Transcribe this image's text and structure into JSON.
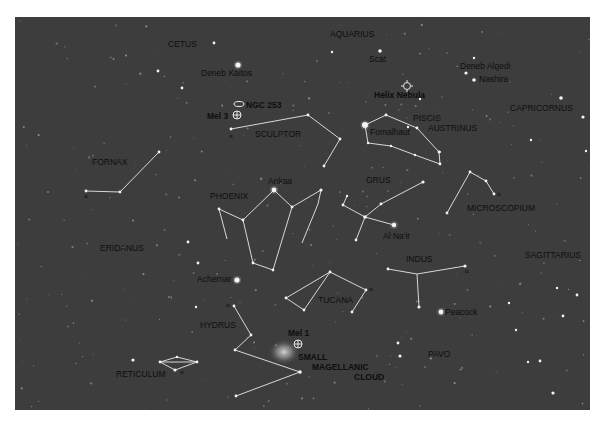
{
  "map": {
    "type": "star-chart",
    "colors": {
      "sky": "#3d3d3d",
      "lines": "#d8d8d8",
      "stars": "#f4f4f4",
      "labels": "#0e0e0e"
    },
    "constellation_labels": [
      {
        "id": "cetus",
        "text": "CETUS",
        "x": 168,
        "y": 47
      },
      {
        "id": "aquarius",
        "text": "AQUARIUS",
        "x": 330,
        "y": 37
      },
      {
        "id": "sculptor",
        "text": "SCULPTOR",
        "x": 255,
        "y": 137
      },
      {
        "id": "piscis-1",
        "text": "PISCIS",
        "x": 413,
        "y": 121
      },
      {
        "id": "piscis-2",
        "text": "AUSTRINUS",
        "x": 428,
        "y": 131
      },
      {
        "id": "capricornus",
        "text": "CAPRICORNUS",
        "x": 510,
        "y": 111
      },
      {
        "id": "fornax",
        "text": "FORNAX",
        "x": 92,
        "y": 165
      },
      {
        "id": "phoenix",
        "text": "PHOENIX",
        "x": 210,
        "y": 199
      },
      {
        "id": "grus",
        "text": "GRUS",
        "x": 366,
        "y": 183
      },
      {
        "id": "microscopium",
        "text": "MICROSCOPIUM",
        "x": 467,
        "y": 211
      },
      {
        "id": "eridanus",
        "text": "ERIDANUS",
        "x": 100,
        "y": 251
      },
      {
        "id": "sagittarius",
        "text": "SAGITTARIUS",
        "x": 525,
        "y": 258
      },
      {
        "id": "indus",
        "text": "INDUS",
        "x": 406,
        "y": 262
      },
      {
        "id": "tucana",
        "text": "TUCANA",
        "x": 318,
        "y": 303
      },
      {
        "id": "hydrus",
        "text": "HYDRUS",
        "x": 200,
        "y": 328
      },
      {
        "id": "pavo",
        "text": "PAVO",
        "x": 428,
        "y": 357
      },
      {
        "id": "reticulum",
        "text": "RETICULUM",
        "x": 116,
        "y": 377
      }
    ],
    "star_labels": [
      {
        "id": "deneb-kaitos",
        "text": "Deneb Kaitos",
        "x": 201,
        "y": 76
      },
      {
        "id": "scat",
        "text": "Scat",
        "x": 369,
        "y": 62
      },
      {
        "id": "deneb-algedi",
        "text": "Deneb Algedi",
        "x": 460,
        "y": 69
      },
      {
        "id": "nashira",
        "text": "Nashira",
        "x": 479,
        "y": 82
      },
      {
        "id": "fomalhaut",
        "text": "Fomalhaut",
        "x": 370,
        "y": 135
      },
      {
        "id": "ankaa",
        "text": "Ankaa",
        "x": 268,
        "y": 184
      },
      {
        "id": "al-nair",
        "text": "Al Na'ir",
        "x": 383,
        "y": 239
      },
      {
        "id": "achernar",
        "text": "Achernar",
        "x": 197,
        "y": 282
      },
      {
        "id": "peacock",
        "text": "Peacock",
        "x": 445,
        "y": 315
      }
    ],
    "object_labels": [
      {
        "id": "ngc-253",
        "text": "NGC 253",
        "x": 246,
        "y": 108
      },
      {
        "id": "mel-3",
        "text": "Mel 3",
        "x": 207,
        "y": 119
      },
      {
        "id": "helix-nebula",
        "text": "Helix Nebula",
        "x": 374,
        "y": 98
      },
      {
        "id": "mel-1",
        "text": "Mel 1",
        "x": 288,
        "y": 336
      },
      {
        "id": "smc-1",
        "text": "SMALL",
        "x": 298,
        "y": 360
      },
      {
        "id": "smc-2",
        "text": "MAGELLANIC",
        "x": 312,
        "y": 370
      },
      {
        "id": "smc-3",
        "text": "CLOUD",
        "x": 354,
        "y": 380
      }
    ],
    "alpha_markers": [
      {
        "x": 229,
        "y": 138
      },
      {
        "x": 84,
        "y": 198
      },
      {
        "x": 497,
        "y": 196
      },
      {
        "x": 369,
        "y": 291
      },
      {
        "x": 465,
        "y": 273
      },
      {
        "x": 226,
        "y": 307
      },
      {
        "x": 180,
        "y": 374
      }
    ],
    "alpha_symbol": "α",
    "constellation_lines": [
      {
        "name": "sculptor",
        "points": [
          [
            231,
            129
          ],
          [
            308,
            115
          ],
          [
            340,
            139
          ],
          [
            324,
            166
          ]
        ]
      },
      {
        "name": "piscis-austrinus",
        "points": [
          [
            365,
            125
          ],
          [
            386,
            115
          ],
          [
            417,
            128
          ],
          [
            439,
            152
          ],
          [
            440,
            164
          ],
          [
            415,
            155
          ],
          [
            391,
            146
          ],
          [
            368,
            143
          ],
          [
            365,
            125
          ]
        ]
      },
      {
        "name": "fornax",
        "points": [
          [
            86,
            191
          ],
          [
            120,
            192
          ],
          [
            159,
            152
          ]
        ]
      },
      {
        "name": "phoenix-a",
        "points": [
          [
            219,
            209
          ],
          [
            243,
            220
          ],
          [
            274,
            190
          ],
          [
            292,
            207
          ],
          [
            321,
            190
          ],
          [
            318,
            204
          ],
          [
            302,
            243
          ]
        ]
      },
      {
        "name": "phoenix-b",
        "points": [
          [
            219,
            209
          ],
          [
            227,
            239
          ]
        ]
      },
      {
        "name": "phoenix-c",
        "points": [
          [
            243,
            220
          ],
          [
            253,
            263
          ],
          [
            273,
            270
          ],
          [
            292,
            207
          ]
        ]
      },
      {
        "name": "grus-a",
        "points": [
          [
            347,
            196
          ],
          [
            343,
            205
          ],
          [
            365,
            217
          ],
          [
            381,
            204
          ],
          [
            423,
            182
          ]
        ]
      },
      {
        "name": "grus-b",
        "points": [
          [
            365,
            217
          ],
          [
            394,
            225
          ]
        ]
      },
      {
        "name": "grus-c",
        "points": [
          [
            365,
            217
          ],
          [
            356,
            240
          ]
        ]
      },
      {
        "name": "microscopium",
        "points": [
          [
            447,
            213
          ],
          [
            470,
            172
          ],
          [
            486,
            181
          ],
          [
            494,
            194
          ]
        ]
      },
      {
        "name": "tucana",
        "points": [
          [
            286,
            298
          ],
          [
            304,
            310
          ],
          [
            330,
            272
          ],
          [
            366,
            290
          ],
          [
            352,
            312
          ]
        ]
      },
      {
        "name": "tucana-b",
        "points": [
          [
            330,
            272
          ],
          [
            286,
            298
          ]
        ]
      },
      {
        "name": "indus-a",
        "points": [
          [
            388,
            269
          ],
          [
            417,
            274
          ],
          [
            465,
            266
          ]
        ]
      },
      {
        "name": "indus-b",
        "points": [
          [
            417,
            274
          ],
          [
            419,
            307
          ]
        ]
      },
      {
        "name": "hydrus",
        "points": [
          [
            234,
            306
          ],
          [
            251,
            335
          ],
          [
            235,
            350
          ],
          [
            300,
            372
          ],
          [
            236,
            396
          ]
        ]
      },
      {
        "name": "reticulum",
        "points": [
          [
            160,
            362
          ],
          [
            177,
            357
          ],
          [
            197,
            362
          ],
          [
            175,
            370
          ],
          [
            160,
            362
          ]
        ]
      },
      {
        "name": "reticulum-b",
        "points": [
          [
            160,
            362
          ],
          [
            197,
            362
          ]
        ]
      }
    ],
    "bright_stars": [
      [
        238,
        65,
        2.6
      ],
      [
        365,
        125,
        3
      ],
      [
        274,
        190,
        2.4
      ],
      [
        237,
        280,
        2.6
      ],
      [
        441,
        312,
        2.4
      ],
      [
        394,
        225,
        2.2
      ],
      [
        380,
        51,
        1.8
      ],
      [
        474,
        80,
        1.8
      ],
      [
        466,
        73,
        1.6
      ],
      [
        300,
        372,
        1.8
      ],
      [
        365,
        217,
        1.8
      ],
      [
        423,
        182,
        1.6
      ],
      [
        321,
        190,
        1.6
      ],
      [
        465,
        266,
        1.6
      ],
      [
        419,
        307,
        1.6
      ],
      [
        175,
        370,
        1.6
      ],
      [
        234,
        306,
        1.4
      ],
      [
        292,
        207,
        1.4
      ],
      [
        243,
        220,
        1.4
      ],
      [
        253,
        263,
        1.4
      ],
      [
        273,
        270,
        1.4
      ],
      [
        219,
        209,
        1.4
      ],
      [
        308,
        115,
        1.4
      ],
      [
        340,
        139,
        1.4
      ],
      [
        324,
        166,
        1.4
      ],
      [
        231,
        129,
        1.4
      ],
      [
        86,
        191,
        1.4
      ],
      [
        159,
        152,
        1.4
      ],
      [
        120,
        192,
        1.4
      ],
      [
        470,
        172,
        1.4
      ],
      [
        486,
        181,
        1.4
      ],
      [
        494,
        194,
        1.4
      ],
      [
        447,
        213,
        1.4
      ],
      [
        330,
        272,
        1.4
      ],
      [
        366,
        290,
        1.4
      ],
      [
        286,
        298,
        1.4
      ],
      [
        304,
        310,
        1.4
      ],
      [
        352,
        312,
        1.4
      ],
      [
        388,
        269,
        1.4
      ],
      [
        251,
        335,
        1.4
      ],
      [
        235,
        350,
        1.4
      ],
      [
        236,
        396,
        1.4
      ],
      [
        160,
        362,
        1.4
      ],
      [
        197,
        362,
        1.4
      ],
      [
        177,
        357,
        1.2
      ],
      [
        343,
        205,
        1.4
      ],
      [
        347,
        196,
        1.2
      ],
      [
        381,
        204,
        1.4
      ],
      [
        356,
        240,
        1.4
      ],
      [
        386,
        115,
        1.4
      ],
      [
        417,
        128,
        1.4
      ],
      [
        439,
        152,
        1.4
      ],
      [
        440,
        164,
        1.4
      ],
      [
        415,
        155,
        1.2
      ],
      [
        391,
        146,
        1.2
      ],
      [
        368,
        143,
        1.2
      ],
      [
        561,
        98,
        1.8
      ],
      [
        583,
        117,
        1.6
      ],
      [
        214,
        43,
        1.4
      ],
      [
        158,
        71,
        1.4
      ],
      [
        133,
        360,
        1.6
      ],
      [
        400,
        356,
        1.6
      ],
      [
        553,
        393,
        1.6
      ],
      [
        398,
        343,
        1.4
      ],
      [
        540,
        361,
        1.4
      ],
      [
        188,
        242,
        1.4
      ],
      [
        198,
        263,
        1.4
      ],
      [
        182,
        88,
        1.4
      ],
      [
        196,
        307,
        1.2
      ],
      [
        557,
        288,
        1.2
      ],
      [
        563,
        316,
        1.4
      ],
      [
        474,
        58,
        1.2
      ],
      [
        509,
        303,
        1.2
      ],
      [
        577,
        295,
        1.4
      ],
      [
        516,
        330,
        1.2
      ],
      [
        528,
        362,
        1.2
      ],
      [
        586,
        151,
        1.2
      ],
      [
        531,
        140,
        1.2
      ],
      [
        420,
        99,
        1.2
      ],
      [
        332,
        52,
        1.2
      ],
      [
        408,
        127,
        1.2
      ],
      [
        440,
        152,
        1.0
      ]
    ],
    "faint_star_seed": 20250
  }
}
